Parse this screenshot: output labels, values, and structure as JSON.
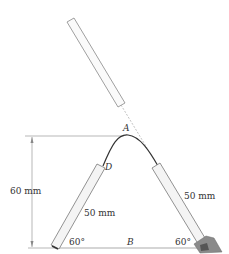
{
  "labels": {
    "point_a": "A",
    "point_d": "D",
    "point_b": "B",
    "height_dim": "60 mm",
    "left_tube_len": "50 mm",
    "right_tube_len": "50 mm",
    "left_angle": "60°",
    "right_angle": "60°"
  },
  "colors": {
    "outline": "#777777",
    "wire": "#333333",
    "tube_fill": "#f4f4f4",
    "support": "#8a8a8a"
  }
}
